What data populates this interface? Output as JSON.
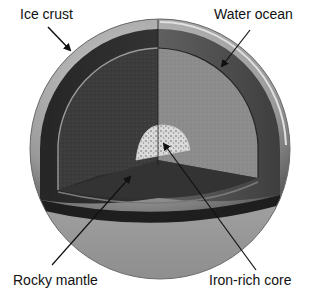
{
  "diagram": {
    "type": "cutaway-sphere",
    "labels": {
      "ice_crust": "Ice crust",
      "water_ocean": "Water ocean",
      "rocky_mantle": "Rocky mantle",
      "iron_core": "Iron-rich core"
    },
    "layers": [
      {
        "name": "Ice crust",
        "order": 1
      },
      {
        "name": "Water ocean",
        "order": 2
      },
      {
        "name": "Rocky mantle",
        "order": 3
      },
      {
        "name": "Iron-rich core",
        "order": 4
      }
    ],
    "colors": {
      "background": "#ffffff",
      "crust": "#a8a8a8",
      "ocean_dark": "#2e2e2e",
      "ocean_light": "#5a5a5a",
      "mantle_dark": "#3a3a3a",
      "mantle_light": "#8a8a8a",
      "core": "#d8d8d8",
      "arrow": "#111111",
      "text": "#111111"
    }
  }
}
